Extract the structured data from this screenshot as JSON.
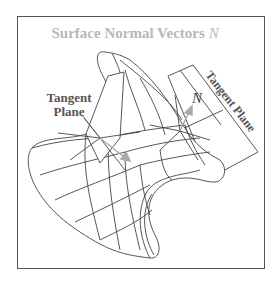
{
  "figure": {
    "title": "Surface Normal Vectors",
    "title_symbol": "N⃗",
    "labels": {
      "tangent_plane_left_line1": "Tangent",
      "tangent_plane_left_line2": "Plane",
      "tangent_plane_right": "Tangent Plane",
      "normal_vector": "N⃗"
    },
    "colors": {
      "title": "#b8b8b8",
      "lines": "#444444",
      "label": "#555555",
      "vector": "#aaaaaa",
      "frame": "#555555"
    }
  }
}
